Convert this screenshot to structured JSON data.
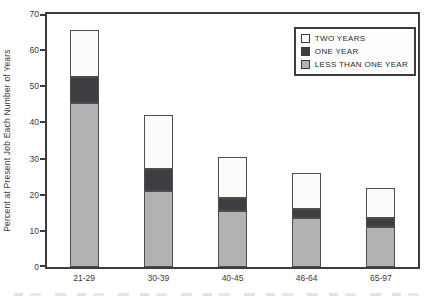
{
  "chart_data": {
    "type": "bar",
    "stacked": true,
    "title": "",
    "xlabel": "",
    "ylabel": "Percent at Present Job Each Number of Years",
    "ylim": [
      0,
      70
    ],
    "yticks": [
      0,
      10,
      20,
      30,
      40,
      50,
      60,
      70
    ],
    "grid": false,
    "categories": [
      "21-29",
      "30-39",
      "40-45",
      "46-64",
      "65-97"
    ],
    "series": [
      {
        "name": "LESS THAN ONE YEAR",
        "color": "#b2b2b4",
        "values": [
          45.5,
          21,
          15.5,
          13.5,
          11
        ]
      },
      {
        "name": "ONE YEAR",
        "color": "#3e3e42",
        "values": [
          7,
          6,
          3.5,
          2.5,
          2.5
        ]
      },
      {
        "name": "TWO YEARS",
        "color": "#fbfbf9",
        "values": [
          13,
          15,
          11.5,
          10,
          8.5
        ]
      }
    ],
    "stack_totals": [
      65.5,
      42,
      30.5,
      26,
      22
    ],
    "legend_position": "top-right",
    "legend_order": [
      "TWO YEARS",
      "ONE YEAR",
      "LESS THAN ONE YEAR"
    ]
  }
}
